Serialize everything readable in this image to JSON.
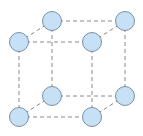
{
  "diagram": {
    "type": "simple-cubic-lattice",
    "colors": {
      "atom_fill": "#c6e0f6",
      "atom_stroke": "#7d8fa3",
      "edge": "#8a8a8a",
      "background": "#ffffff"
    },
    "atom_radius": 9.5,
    "atoms": [
      {
        "id": "back-top-left",
        "x": 52,
        "y": 21
      },
      {
        "id": "back-top-right",
        "x": 125,
        "y": 21
      },
      {
        "id": "front-top-left",
        "x": 19,
        "y": 42
      },
      {
        "id": "front-top-right",
        "x": 92,
        "y": 42
      },
      {
        "id": "back-bottom-left",
        "x": 52,
        "y": 96
      },
      {
        "id": "back-bottom-right",
        "x": 125,
        "y": 96
      },
      {
        "id": "front-bottom-left",
        "x": 19,
        "y": 117
      },
      {
        "id": "front-bottom-right",
        "x": 92,
        "y": 117
      }
    ],
    "edges": [
      [
        "back-top-left",
        "back-top-right"
      ],
      [
        "front-top-left",
        "front-top-right"
      ],
      [
        "back-bottom-left",
        "back-bottom-right"
      ],
      [
        "front-bottom-left",
        "front-bottom-right"
      ],
      [
        "back-top-left",
        "back-bottom-left"
      ],
      [
        "back-top-right",
        "back-bottom-right"
      ],
      [
        "front-top-left",
        "front-bottom-left"
      ],
      [
        "front-top-right",
        "front-bottom-right"
      ],
      [
        "front-top-left",
        "back-top-left"
      ],
      [
        "front-top-right",
        "back-top-right"
      ],
      [
        "front-bottom-left",
        "back-bottom-left"
      ],
      [
        "front-bottom-right",
        "back-bottom-right"
      ]
    ]
  }
}
